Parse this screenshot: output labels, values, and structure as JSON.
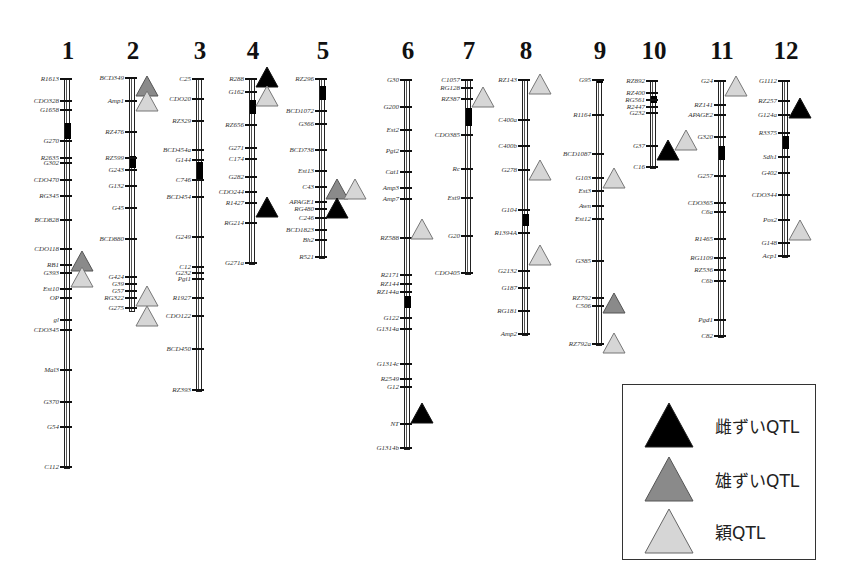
{
  "figure": {
    "type": "rice linkage map with QTL positions",
    "colors": {
      "female_qtl": "#000000",
      "male_qtl": "#8a8a8a",
      "spikelet_qtl": "#d6d6d6",
      "outline": "#444444"
    }
  },
  "legend": {
    "items": [
      {
        "label": "雌ずいQTL",
        "kind": "female",
        "color": "#000000"
      },
      {
        "label": "雄ずいQTL",
        "kind": "male",
        "color": "#8a8a8a"
      },
      {
        "label": "穎QTL",
        "kind": "spikelet",
        "color": "#d6d6d6"
      }
    ]
  },
  "chromosomes": [
    {
      "id": "1",
      "x": 66,
      "num_y": 38,
      "top": 79,
      "bottom": 467,
      "centromere": [
        123,
        139
      ],
      "markers": [
        [
          "R1613",
          79
        ],
        [
          "CDO328",
          101
        ],
        [
          "G1658",
          110
        ],
        [
          "G270",
          141
        ],
        [
          "R2635",
          158
        ],
        [
          "G302",
          163
        ],
        [
          "CDO470",
          180
        ],
        [
          "RG345",
          196
        ],
        [
          "BCD828",
          220
        ],
        [
          "CDO118",
          249
        ],
        [
          "RB1",
          265
        ],
        [
          "G393",
          273
        ],
        [
          "Est10",
          289
        ],
        [
          "OP",
          298
        ],
        [
          "gl",
          320
        ],
        [
          "CDO345",
          330
        ],
        [
          "Mal3",
          370
        ],
        [
          "G370",
          402
        ],
        [
          "G54",
          427
        ],
        [
          "C112",
          467
        ]
      ],
      "qtls": [
        [
          "male",
          261,
          "right"
        ],
        [
          "spikelet",
          277,
          "right"
        ]
      ]
    },
    {
      "id": "2",
      "x": 131,
      "num_y": 38,
      "top": 78,
      "bottom": 310,
      "centromere": [
        156,
        168
      ],
      "markers": [
        [
          "BCD349",
          78
        ],
        [
          "Amp1",
          101
        ],
        [
          "RZ476",
          132
        ],
        [
          "RZ599",
          158
        ],
        [
          "G243",
          170
        ],
        [
          "G132",
          186
        ],
        [
          "G45",
          208
        ],
        [
          "BCD880",
          239
        ],
        [
          "G424",
          277
        ],
        [
          "G39",
          284
        ],
        [
          "G57",
          291
        ],
        [
          "RG322",
          298
        ],
        [
          "G275",
          308
        ]
      ],
      "qtls": [
        [
          "male",
          86,
          "right"
        ],
        [
          "spikelet",
          101,
          "right"
        ],
        [
          "spikelet",
          296,
          "right"
        ],
        [
          "spikelet",
          316,
          "right"
        ]
      ]
    },
    {
      "id": "3",
      "x": 198,
      "num_y": 38,
      "top": 79,
      "bottom": 390,
      "centromere": [
        162,
        180
      ],
      "markers": [
        [
          "C25",
          79
        ],
        [
          "CDO20",
          99
        ],
        [
          "RZ329",
          121
        ],
        [
          "BCD454a",
          150
        ],
        [
          "G144",
          160
        ],
        [
          "C746",
          180
        ],
        [
          "BCD454",
          197
        ],
        [
          "G249",
          237
        ],
        [
          "C12",
          267
        ],
        [
          "G232",
          273
        ],
        [
          "Pgi1",
          279
        ],
        [
          "R1927",
          298
        ],
        [
          "CDO122",
          316
        ],
        [
          "BCD450",
          349
        ],
        [
          "RZ393",
          390
        ]
      ],
      "qtls": []
    },
    {
      "id": "4",
      "x": 251,
      "num_y": 38,
      "top": 79,
      "bottom": 263,
      "centromere": [
        100,
        114
      ],
      "markers": [
        [
          "R288",
          79
        ],
        [
          "G162",
          92
        ],
        [
          "RZ656",
          125
        ],
        [
          "G271",
          148
        ],
        [
          "C174",
          159
        ],
        [
          "G282",
          177
        ],
        [
          "CDO244",
          192
        ],
        [
          "R1427",
          203
        ],
        [
          "RG214",
          223
        ],
        [
          "G271a",
          263
        ]
      ],
      "qtls": [
        [
          "female",
          77,
          "right"
        ],
        [
          "spikelet",
          96,
          "right"
        ],
        [
          "female",
          207,
          "right"
        ]
      ]
    },
    {
      "id": "5",
      "x": 321,
      "num_y": 38,
      "top": 79,
      "bottom": 257,
      "centromere": [
        86,
        100
      ],
      "markers": [
        [
          "RZ296",
          79
        ],
        [
          "BCD1072",
          111
        ],
        [
          "G366",
          124
        ],
        [
          "BCD738",
          150
        ],
        [
          "Est13",
          171
        ],
        [
          "C43",
          187
        ],
        [
          "APAGE1",
          202
        ],
        [
          "RG480",
          209
        ],
        [
          "C246",
          218
        ],
        [
          "BCD1823",
          230
        ],
        [
          "Bh2",
          240
        ],
        [
          "R521",
          257
        ]
      ],
      "qtls": [
        [
          "male",
          189,
          "right"
        ],
        [
          "spikelet",
          189,
          "right2"
        ],
        [
          "female",
          208,
          "right"
        ]
      ]
    },
    {
      "id": "6",
      "x": 406,
      "num_y": 38,
      "top": 80,
      "bottom": 448,
      "centromere": [
        296,
        308
      ],
      "markers": [
        [
          "G30",
          80
        ],
        [
          "G200",
          107
        ],
        [
          "Est2",
          130
        ],
        [
          "Pgi2",
          151
        ],
        [
          "Cat1",
          172
        ],
        [
          "Amp3",
          188
        ],
        [
          "Amp7",
          199
        ],
        [
          "RZ588",
          238
        ],
        [
          "R2171",
          275
        ],
        [
          "RZ144",
          284
        ],
        [
          "RZ144a",
          292
        ],
        [
          "G122",
          318
        ],
        [
          "G1314a",
          329
        ],
        [
          "G1314c",
          364
        ],
        [
          "R2549",
          379
        ],
        [
          "G12",
          387
        ],
        [
          "NT",
          424
        ],
        [
          "G1314b",
          448
        ]
      ],
      "qtls": [
        [
          "spikelet",
          229,
          "right"
        ],
        [
          "female",
          413,
          "right"
        ]
      ]
    },
    {
      "id": "7",
      "x": 467,
      "num_y": 38,
      "top": 80,
      "bottom": 273,
      "centromere": [
        108,
        126
      ],
      "markers": [
        [
          "C1057",
          80
        ],
        [
          "RG128",
          88
        ],
        [
          "RZ387",
          99
        ],
        [
          "CDO385",
          135
        ],
        [
          "Rc",
          169
        ],
        [
          "Est9",
          198
        ],
        [
          "G20",
          236
        ],
        [
          "CDO405",
          273
        ]
      ],
      "qtls": [
        [
          "spikelet",
          97,
          "right"
        ]
      ]
    },
    {
      "id": "8",
      "x": 524,
      "num_y": 38,
      "top": 80,
      "bottom": 334,
      "centromere": [
        214,
        226
      ],
      "markers": [
        [
          "RZ143",
          80
        ],
        [
          "C400a",
          120
        ],
        [
          "C400b",
          146
        ],
        [
          "G278",
          170
        ],
        [
          "G104",
          210
        ],
        [
          "R1394A",
          233
        ],
        [
          "G2132",
          271
        ],
        [
          "G187",
          288
        ],
        [
          "RG181",
          311
        ],
        [
          "Amp2",
          334
        ]
      ],
      "qtls": [
        [
          "spikelet",
          84,
          "right"
        ],
        [
          "spikelet",
          170,
          "right"
        ],
        [
          "spikelet",
          255,
          "right"
        ]
      ]
    },
    {
      "id": "9",
      "x": 598,
      "num_y": 38,
      "top": 80,
      "bottom": 344,
      "centromere": [
        79,
        83
      ],
      "markers": [
        [
          "G95",
          80
        ],
        [
          "R1164",
          115
        ],
        [
          "BCD1087",
          154
        ],
        [
          "G103",
          178
        ],
        [
          "Est3",
          191
        ],
        [
          "Awn",
          206
        ],
        [
          "Est12",
          219
        ],
        [
          "G385",
          261
        ],
        [
          "RZ792",
          298
        ],
        [
          "C506",
          306
        ],
        [
          "RZ792a",
          344
        ]
      ],
      "qtls": [
        [
          "spikelet",
          178,
          "right"
        ],
        [
          "male",
          303,
          "right"
        ],
        [
          "spikelet",
          343,
          "right"
        ]
      ]
    },
    {
      "id": "10",
      "x": 652,
      "num_y": 38,
      "top": 81,
      "bottom": 167,
      "centromere": [
        96,
        103
      ],
      "markers": [
        [
          "RZ892",
          81
        ],
        [
          "RZ400",
          93
        ],
        [
          "RG561",
          100
        ],
        [
          "R2447",
          107
        ],
        [
          "G232",
          113
        ],
        [
          "G37",
          146
        ],
        [
          "C16",
          167
        ]
      ],
      "qtls": [
        [
          "spikelet",
          140,
          "right2"
        ],
        [
          "female",
          150,
          "right"
        ]
      ]
    },
    {
      "id": "11",
      "x": 720,
      "num_y": 38,
      "top": 81,
      "bottom": 336,
      "centromere": [
        146,
        160
      ],
      "markers": [
        [
          "G24",
          81
        ],
        [
          "RZ141",
          105
        ],
        [
          "APAGE2",
          115
        ],
        [
          "G320",
          137
        ],
        [
          "G257",
          176
        ],
        [
          "CDO365",
          203
        ],
        [
          "C6a",
          212
        ],
        [
          "R1465",
          239
        ],
        [
          "RG1109",
          258
        ],
        [
          "RZ536",
          270
        ],
        [
          "C6b",
          281
        ],
        [
          "Pgd1",
          320
        ],
        [
          "C82",
          336
        ]
      ],
      "qtls": [
        [
          "spikelet",
          86,
          "right"
        ]
      ]
    },
    {
      "id": "12",
      "x": 784,
      "num_y": 38,
      "top": 81,
      "bottom": 256,
      "centromere": [
        136,
        149
      ],
      "markers": [
        [
          "G1112",
          81
        ],
        [
          "RZ257",
          101
        ],
        [
          "G124a",
          115
        ],
        [
          "R3375",
          133
        ],
        [
          "Sdh1",
          157
        ],
        [
          "G402",
          173
        ],
        [
          "CDO344",
          195
        ],
        [
          "Pos2",
          220
        ],
        [
          "G148",
          243
        ],
        [
          "Acp1",
          256
        ]
      ],
      "qtls": [
        [
          "female",
          108,
          "right"
        ],
        [
          "spikelet",
          230,
          "right"
        ]
      ]
    }
  ]
}
